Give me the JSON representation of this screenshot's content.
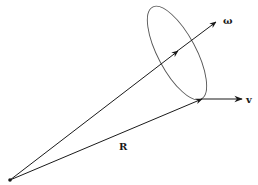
{
  "diagram": {
    "type": "vector-diagram",
    "labels": {
      "omega": "ω",
      "v": "v",
      "R": "R"
    },
    "colors": {
      "line": "#1a1a1a",
      "ellipse": "#555555",
      "background": "#ffffff"
    },
    "elements": [
      {
        "name": "origin-point",
        "x": 10,
        "y": 180
      },
      {
        "name": "vector-R",
        "from": [
          10,
          180
        ],
        "to": [
          202,
          99
        ],
        "label": "R"
      },
      {
        "name": "vector-omega",
        "from": [
          10,
          180
        ],
        "to": [
          216,
          22
        ],
        "label": "ω"
      },
      {
        "name": "vector-v",
        "from": [
          202,
          99
        ],
        "to": [
          242,
          99
        ],
        "label": "v"
      },
      {
        "name": "orbit-ellipse",
        "cx": 177,
        "cy": 53,
        "rx": 20,
        "ry": 52,
        "rotate": -28
      }
    ]
  }
}
